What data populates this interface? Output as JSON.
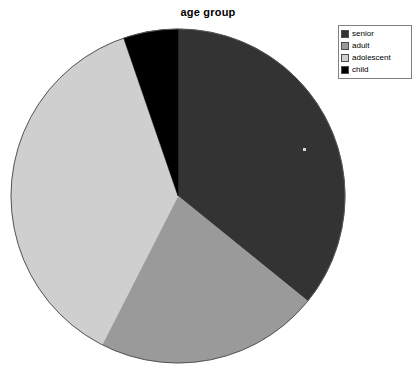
{
  "chart_data": {
    "type": "pie",
    "title": "age group",
    "categories": [
      "senior",
      "adult",
      "adolescent",
      "child"
    ],
    "values": [
      36,
      22,
      37,
      5
    ],
    "units": "percent",
    "start_angle_deg": 0,
    "direction": "clockwise",
    "slice_boundaries_deg": [
      0,
      129,
      207,
      341,
      360
    ],
    "colors": [
      "#333333",
      "#9a9a9a",
      "#cfcfcf",
      "#000000"
    ],
    "legend": {
      "position": "top-right",
      "entries": [
        {
          "label": "senior",
          "color": "#333333"
        },
        {
          "label": "adult",
          "color": "#9a9a9a"
        },
        {
          "label": "adolescent",
          "color": "#cfcfcf"
        },
        {
          "label": "child",
          "color": "#000000"
        }
      ]
    },
    "xlabel": "",
    "ylabel": "",
    "grid": false
  },
  "chart": {
    "title": "age group",
    "center_x": 178,
    "center_y": 196,
    "radius": 167,
    "outline_color": "#555555"
  },
  "legend": {
    "items": [
      {
        "label": "senior",
        "color": "#333333"
      },
      {
        "label": "adult",
        "color": "#9a9a9a"
      },
      {
        "label": "adolescent",
        "color": "#cfcfcf"
      },
      {
        "label": "child",
        "color": "#000000"
      }
    ]
  }
}
